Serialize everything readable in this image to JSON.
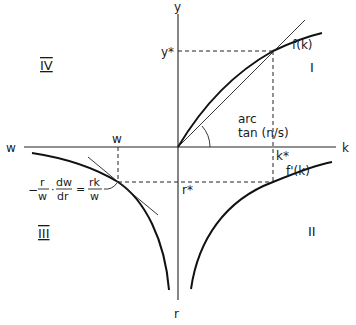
{
  "figure": {
    "axes": {
      "up_label": "y",
      "right_label": "k",
      "left_label": "w",
      "down_label": "r"
    },
    "quadrants": {
      "q1": "I",
      "q2": "II",
      "q3": "III",
      "q4": "IV"
    },
    "curves": {
      "production": "f(k)",
      "marginal_product": "f'(k)"
    },
    "markers": {
      "y_star": "y*",
      "k_star": "k*",
      "r_star": "r*",
      "w": "w"
    },
    "angle_label": {
      "line1": "arc",
      "line2": "tan (n/s)"
    },
    "elasticity_label": {
      "lhs_neg": "−",
      "lhs_frac1_num": "r",
      "lhs_frac1_den": "w",
      "dot": "·",
      "lhs_frac2_num": "dw",
      "lhs_frac2_den": "dr",
      "equals": "=",
      "rhs_num": "rk",
      "rhs_den": "w"
    }
  }
}
